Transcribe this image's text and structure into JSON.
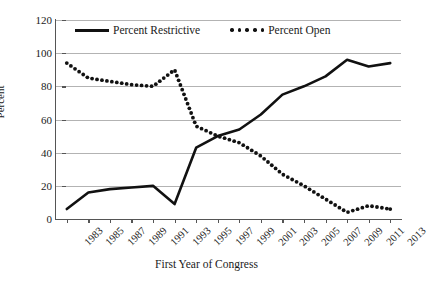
{
  "chart_data": {
    "type": "line",
    "title": "",
    "xlabel": "First Year of Congress",
    "ylabel": "Percent",
    "ylim": [
      0,
      120
    ],
    "yticks": [
      0,
      20,
      40,
      60,
      80,
      100,
      120
    ],
    "grid": true,
    "legend_position": "top-center",
    "categories": [
      "1983",
      "1985",
      "1987",
      "1989",
      "1991",
      "1993",
      "1995",
      "1997",
      "1999",
      "2001",
      "2003",
      "2005",
      "2007",
      "2009",
      "2011",
      "2013"
    ],
    "series": [
      {
        "name": "Percent Restrictive",
        "style": "solid",
        "color": "#111111",
        "values": [
          6,
          16,
          18,
          19,
          20,
          9,
          43,
          50,
          54,
          63,
          75,
          80,
          86,
          96,
          92,
          94
        ]
      },
      {
        "name": "Percent Open",
        "style": "dotted",
        "color": "#111111",
        "values": [
          94,
          85,
          83,
          81,
          80,
          90,
          56,
          50,
          46,
          38,
          27,
          20,
          12,
          4,
          8,
          6
        ]
      }
    ]
  },
  "axes": {
    "y_title": "Percent",
    "x_title": "First Year of Congress",
    "y_tick_labels": [
      "120",
      "100",
      "80",
      "60",
      "40",
      "20",
      "0"
    ],
    "x_tick_labels": [
      "1983",
      "1985",
      "1987",
      "1989",
      "1991",
      "1993",
      "1995",
      "1997",
      "1999",
      "2001",
      "2003",
      "2005",
      "2007",
      "2009",
      "2011",
      "2013"
    ]
  },
  "legend": {
    "entries": [
      {
        "label": "Percent Restrictive",
        "marker": "solid-line-swatch"
      },
      {
        "label": "Percent Open",
        "marker": "dotted-line-swatch"
      }
    ]
  }
}
